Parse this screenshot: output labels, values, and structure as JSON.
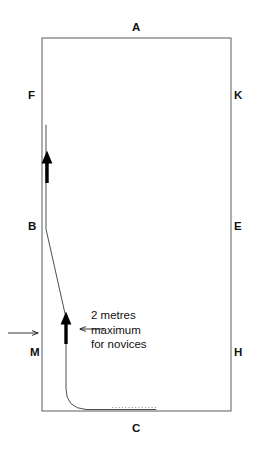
{
  "figure": {
    "background_color": "#ffffff",
    "ink_color": "#111111",
    "rail_color": "#6a6a6a",
    "track_color": "#3a3a3a",
    "arrow_color": "#000000"
  },
  "arena": {
    "left": 42,
    "top": 38,
    "right": 231,
    "bottom": 411,
    "width": 189,
    "height": 373
  },
  "markers": [
    {
      "label": "A",
      "x": 137,
      "y": 28,
      "side": "top"
    },
    {
      "label": "F",
      "x": 31,
      "y": 96,
      "side": "left"
    },
    {
      "label": "K",
      "x": 236,
      "y": 96,
      "side": "right"
    },
    {
      "label": "B",
      "x": 31,
      "y": 227,
      "side": "left"
    },
    {
      "label": "E",
      "x": 236,
      "y": 227,
      "side": "right"
    },
    {
      "label": "M",
      "x": 33,
      "y": 353,
      "side": "left"
    },
    {
      "label": "H",
      "x": 236,
      "y": 353,
      "side": "right"
    },
    {
      "label": "C",
      "x": 136,
      "y": 429,
      "side": "bottom"
    }
  ],
  "annotation": {
    "x": 91,
    "y": 307,
    "lines": [
      "2 metres",
      "maximum",
      "for novices"
    ]
  },
  "track": {
    "description": "Ridden track: straight along the rail from above F to B, then a gradual diagonal inwards to about 2 metres from the rail, held straight past M, then curving onto the bottom rail before C.",
    "path": "M 46 125 L 46 229 L 66 318 L 66 389 Q 66 408 86 409.5 L 156 409.5",
    "stroke_width": 0.9
  },
  "direction_arrows": [
    {
      "name": "upper",
      "x": 47,
      "y_tail": 183,
      "y_head": 152,
      "width": 4.2
    },
    {
      "name": "lower",
      "x": 66,
      "y_tail": 344,
      "y_head": 313,
      "width": 4.2
    }
  ],
  "pointer_arrows": [
    {
      "name": "rail-pointer",
      "x_tail": 8,
      "x_head": 38,
      "y": 333,
      "direction": "right"
    },
    {
      "name": "track-pointer",
      "x_tail": 104,
      "x_head": 78,
      "y": 329,
      "direction": "left"
    }
  ],
  "dotted_segment": {
    "x_start": 112,
    "x_end": 156,
    "y": 407.5
  }
}
